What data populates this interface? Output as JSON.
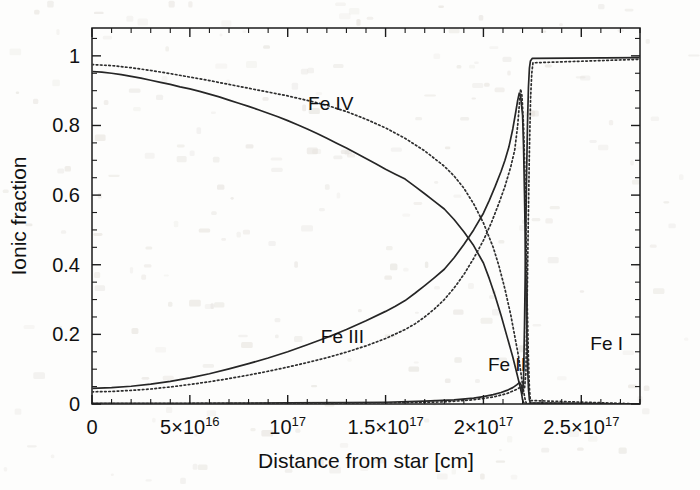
{
  "figure": {
    "name": "ionic-fraction-vs-distance",
    "background_color": "#fdfdfc",
    "ink_color": "#1b1b1b"
  },
  "axes": {
    "x": {
      "title": "Distance from star [cm]",
      "min": 0,
      "max": 2.8e+17,
      "major_ticks": [
        {
          "value": 0,
          "label": "0",
          "mantissa": "",
          "base": "",
          "exponent": ""
        },
        {
          "value": 5e+16,
          "label": "5×10¹⁶",
          "mantissa": "5×",
          "base": "10",
          "exponent": "16"
        },
        {
          "value": 1e+17,
          "label": "10¹⁷",
          "mantissa": "",
          "base": "10",
          "exponent": "17"
        },
        {
          "value": 1.5e+17,
          "label": "1.5×10¹⁷",
          "mantissa": "1.5×",
          "base": "10",
          "exponent": "17"
        },
        {
          "value": 2e+17,
          "label": "2×10¹⁷",
          "mantissa": "2×",
          "base": "10",
          "exponent": "17"
        },
        {
          "value": 2.5e+17,
          "label": "2.5×10¹⁷",
          "mantissa": "2.5×",
          "base": "10",
          "exponent": "17"
        }
      ],
      "minor_tick_step": 1e+16
    },
    "y": {
      "title": "Ionic fraction",
      "min": 0,
      "max": 1.08,
      "major_ticks": [
        {
          "value": 0,
          "label": "0"
        },
        {
          "value": 0.2,
          "label": "0.2"
        },
        {
          "value": 0.4,
          "label": "0.4"
        },
        {
          "value": 0.6,
          "label": "0.6"
        },
        {
          "value": 0.8,
          "label": "0.8"
        },
        {
          "value": 1,
          "label": "1"
        }
      ],
      "minor_tick_step": 0.05
    }
  },
  "annotations": [
    {
      "id": "fe4",
      "text": "Fe IV",
      "x": 1.22e+17,
      "y": 0.845
    },
    {
      "id": "fe3",
      "text": "Fe III",
      "x": 1.28e+17,
      "y": 0.175
    },
    {
      "id": "fe2",
      "text": "Fe II",
      "x": 2.12e+17,
      "y": 0.095
    },
    {
      "id": "fe1",
      "text": "Fe I",
      "x": 2.63e+17,
      "y": 0.155
    }
  ],
  "chart_data": {
    "type": "line",
    "title": "",
    "xlabel": "Distance from star [cm]",
    "ylabel": "Ionic fraction",
    "xlim": [
      0,
      2.8e+17
    ],
    "ylim": [
      0,
      1.08
    ],
    "grid": false,
    "legend": "inline-annotations",
    "x_units": "cm",
    "series": [
      {
        "name": "Fe IV (model A, solid)",
        "style": "solid",
        "points": [
          [
            0.0,
            0.955
          ],
          [
            5000000000000000.0,
            0.953
          ],
          [
            1e+16,
            0.95
          ],
          [
            1.5e+16,
            0.946
          ],
          [
            2e+16,
            0.941
          ],
          [
            2.5e+16,
            0.936
          ],
          [
            3e+16,
            0.93
          ],
          [
            3.5e+16,
            0.924
          ],
          [
            4e+16,
            0.918
          ],
          [
            4.5e+16,
            0.911
          ],
          [
            5e+16,
            0.905
          ],
          [
            5.5e+16,
            0.898
          ],
          [
            6e+16,
            0.89
          ],
          [
            6.5e+16,
            0.882
          ],
          [
            7e+16,
            0.873
          ],
          [
            7.5e+16,
            0.864
          ],
          [
            8e+16,
            0.855
          ],
          [
            8.5e+16,
            0.845
          ],
          [
            9e+16,
            0.835
          ],
          [
            9.5e+16,
            0.825
          ],
          [
            1e+17,
            0.814
          ],
          [
            1.05e+17,
            0.802
          ],
          [
            1.1e+17,
            0.79
          ],
          [
            1.15e+17,
            0.777
          ],
          [
            1.2e+17,
            0.763
          ],
          [
            1.25e+17,
            0.749
          ],
          [
            1.3e+17,
            0.735
          ],
          [
            1.35e+17,
            0.72
          ],
          [
            1.4e+17,
            0.705
          ],
          [
            1.45e+17,
            0.69
          ],
          [
            1.5e+17,
            0.674
          ],
          [
            1.55e+17,
            0.66
          ],
          [
            1.6e+17,
            0.646
          ],
          [
            1.65e+17,
            0.625
          ],
          [
            1.7e+17,
            0.604
          ],
          [
            1.75e+17,
            0.582
          ],
          [
            1.8e+17,
            0.56
          ],
          [
            1.85e+17,
            0.53
          ],
          [
            1.9e+17,
            0.495
          ],
          [
            1.95e+17,
            0.455
          ],
          [
            2e+17,
            0.405
          ],
          [
            2.03e+17,
            0.36
          ],
          [
            2.06e+17,
            0.31
          ],
          [
            2.09e+17,
            0.255
          ],
          [
            2.12e+17,
            0.195
          ],
          [
            2.15e+17,
            0.135
          ],
          [
            2.17e+17,
            0.09
          ],
          [
            2.185e+17,
            0.055
          ],
          [
            2.195e+17,
            0.03
          ],
          [
            2.2e+17,
            0.012
          ],
          [
            2.205e+17,
            0.004
          ],
          [
            2.21e+17,
            0.001
          ],
          [
            2.8e+17,
            0.0
          ]
        ]
      },
      {
        "name": "Fe IV (model B, dotted)",
        "style": "dotted",
        "points": [
          [
            0.0,
            0.975
          ],
          [
            1e+16,
            0.972
          ],
          [
            2e+16,
            0.966
          ],
          [
            3e+16,
            0.958
          ],
          [
            4e+16,
            0.949
          ],
          [
            5e+16,
            0.939
          ],
          [
            6e+16,
            0.929
          ],
          [
            7e+16,
            0.918
          ],
          [
            8e+16,
            0.907
          ],
          [
            9e+16,
            0.896
          ],
          [
            1e+17,
            0.885
          ],
          [
            1.1e+17,
            0.872
          ],
          [
            1.2e+17,
            0.858
          ],
          [
            1.3e+17,
            0.84
          ],
          [
            1.4e+17,
            0.818
          ],
          [
            1.5e+17,
            0.793
          ],
          [
            1.6e+17,
            0.763
          ],
          [
            1.7e+17,
            0.727
          ],
          [
            1.8e+17,
            0.683
          ],
          [
            1.85e+17,
            0.655
          ],
          [
            1.9e+17,
            0.62
          ],
          [
            1.95e+17,
            0.575
          ],
          [
            2e+17,
            0.52
          ],
          [
            2.05e+17,
            0.45
          ],
          [
            2.08e+17,
            0.395
          ],
          [
            2.11e+17,
            0.33
          ],
          [
            2.14e+17,
            0.255
          ],
          [
            2.16e+17,
            0.195
          ],
          [
            2.18e+17,
            0.135
          ],
          [
            2.19e+17,
            0.095
          ],
          [
            2.2e+17,
            0.055
          ],
          [
            2.21e+17,
            0.022
          ],
          [
            2.215e+17,
            0.008
          ],
          [
            2.22e+17,
            0.002
          ],
          [
            2.8e+17,
            0.0
          ]
        ]
      },
      {
        "name": "Fe III (model A, solid)",
        "style": "solid",
        "points": [
          [
            0.0,
            0.045
          ],
          [
            1e+16,
            0.047
          ],
          [
            2e+16,
            0.051
          ],
          [
            3e+16,
            0.057
          ],
          [
            4e+16,
            0.065
          ],
          [
            5e+16,
            0.075
          ],
          [
            6e+16,
            0.087
          ],
          [
            7e+16,
            0.101
          ],
          [
            8e+16,
            0.116
          ],
          [
            9e+16,
            0.132
          ],
          [
            1e+17,
            0.15
          ],
          [
            1.1e+17,
            0.17
          ],
          [
            1.2e+17,
            0.191
          ],
          [
            1.3e+17,
            0.214
          ],
          [
            1.4e+17,
            0.239
          ],
          [
            1.5e+17,
            0.266
          ],
          [
            1.55e+17,
            0.281
          ],
          [
            1.6e+17,
            0.297
          ],
          [
            1.65e+17,
            0.318
          ],
          [
            1.7e+17,
            0.34
          ],
          [
            1.75e+17,
            0.363
          ],
          [
            1.8e+17,
            0.387
          ],
          [
            1.85e+17,
            0.42
          ],
          [
            1.9e+17,
            0.458
          ],
          [
            1.95e+17,
            0.5
          ],
          [
            2e+17,
            0.548
          ],
          [
            2.03e+17,
            0.585
          ],
          [
            2.06e+17,
            0.625
          ],
          [
            2.09e+17,
            0.668
          ],
          [
            2.11e+17,
            0.7
          ],
          [
            2.13e+17,
            0.738
          ],
          [
            2.15e+17,
            0.79
          ],
          [
            2.165e+17,
            0.838
          ],
          [
            2.175e+17,
            0.872
          ],
          [
            2.183e+17,
            0.893
          ],
          [
            2.19e+17,
            0.885
          ],
          [
            2.2e+17,
            0.83
          ],
          [
            2.205e+17,
            0.74
          ],
          [
            2.21e+17,
            0.6
          ],
          [
            2.215e+17,
            0.42
          ],
          [
            2.22e+17,
            0.25
          ],
          [
            2.225e+17,
            0.12
          ],
          [
            2.23e+17,
            0.045
          ],
          [
            2.235e+17,
            0.012
          ],
          [
            2.24e+17,
            0.003
          ],
          [
            2.8e+17,
            0.0
          ]
        ]
      },
      {
        "name": "Fe III (model B, dotted)",
        "style": "dotted",
        "points": [
          [
            0.0,
            0.035
          ],
          [
            1e+16,
            0.036
          ],
          [
            2e+16,
            0.039
          ],
          [
            3e+16,
            0.043
          ],
          [
            4e+16,
            0.049
          ],
          [
            5e+16,
            0.056
          ],
          [
            6e+16,
            0.064
          ],
          [
            7e+16,
            0.073
          ],
          [
            8e+16,
            0.083
          ],
          [
            9e+16,
            0.094
          ],
          [
            1e+17,
            0.106
          ],
          [
            1.1e+17,
            0.119
          ],
          [
            1.2e+17,
            0.133
          ],
          [
            1.3e+17,
            0.149
          ],
          [
            1.4e+17,
            0.167
          ],
          [
            1.5e+17,
            0.188
          ],
          [
            1.6e+17,
            0.214
          ],
          [
            1.65e+17,
            0.23
          ],
          [
            1.7e+17,
            0.25
          ],
          [
            1.75e+17,
            0.273
          ],
          [
            1.8e+17,
            0.3
          ],
          [
            1.85e+17,
            0.333
          ],
          [
            1.9e+17,
            0.372
          ],
          [
            1.95e+17,
            0.418
          ],
          [
            2e+17,
            0.47
          ],
          [
            2.04e+17,
            0.52
          ],
          [
            2.08e+17,
            0.578
          ],
          [
            2.11e+17,
            0.625
          ],
          [
            2.14e+17,
            0.682
          ],
          [
            2.16e+17,
            0.73
          ],
          [
            2.175e+17,
            0.8
          ],
          [
            2.185e+17,
            0.87
          ],
          [
            2.19e+17,
            0.905
          ],
          [
            2.197e+17,
            0.885
          ],
          [
            2.205e+17,
            0.8
          ],
          [
            2.212e+17,
            0.66
          ],
          [
            2.218e+17,
            0.47
          ],
          [
            2.224e+17,
            0.28
          ],
          [
            2.23e+17,
            0.13
          ],
          [
            2.235e+17,
            0.045
          ],
          [
            2.24e+17,
            0.01
          ],
          [
            2.8e+17,
            0.0
          ]
        ]
      },
      {
        "name": "Fe II (model A, solid)",
        "style": "solid",
        "points": [
          [
            0.0,
            0.002
          ],
          [
            5e+16,
            0.002
          ],
          [
            1e+17,
            0.003
          ],
          [
            1.3e+17,
            0.004
          ],
          [
            1.5e+17,
            0.005
          ],
          [
            1.7e+17,
            0.008
          ],
          [
            1.85e+17,
            0.012
          ],
          [
            1.95e+17,
            0.017
          ],
          [
            2e+17,
            0.021
          ],
          [
            2.05e+17,
            0.027
          ],
          [
            2.09e+17,
            0.033
          ],
          [
            2.12e+17,
            0.039
          ],
          [
            2.15e+17,
            0.047
          ],
          [
            2.17e+17,
            0.055
          ],
          [
            2.185e+17,
            0.062
          ],
          [
            2.195e+17,
            0.052
          ],
          [
            2.2e+17,
            0.03
          ],
          [
            2.205e+17,
            0.07
          ],
          [
            2.21e+17,
            0.23
          ],
          [
            2.215e+17,
            0.44
          ],
          [
            2.22e+17,
            0.64
          ],
          [
            2.225e+17,
            0.8
          ],
          [
            2.23e+17,
            0.91
          ],
          [
            2.235e+17,
            0.965
          ],
          [
            2.24e+17,
            0.985
          ],
          [
            2.25e+17,
            0.993
          ],
          [
            2.8e+17,
            0.995
          ]
        ]
      },
      {
        "name": "Fe II (model B, dotted)",
        "style": "dotted",
        "points": [
          [
            0.0,
            0.001
          ],
          [
            1e+17,
            0.002
          ],
          [
            1.5e+17,
            0.003
          ],
          [
            1.8e+17,
            0.006
          ],
          [
            1.95e+17,
            0.012
          ],
          [
            2.05e+17,
            0.02
          ],
          [
            2.12e+17,
            0.03
          ],
          [
            2.17e+17,
            0.042
          ],
          [
            2.2e+17,
            0.052
          ],
          [
            2.21e+17,
            0.045
          ],
          [
            2.217e+17,
            0.09
          ],
          [
            2.223e+17,
            0.28
          ],
          [
            2.229e+17,
            0.52
          ],
          [
            2.235e+17,
            0.73
          ],
          [
            2.241e+17,
            0.88
          ],
          [
            2.247e+17,
            0.95
          ],
          [
            2.253e+17,
            0.98
          ],
          [
            2.8e+17,
            0.99
          ]
        ]
      }
    ],
    "ionization_front": {
      "x": 2.215e+17,
      "description": "sharp vertical transition at the ionization front"
    }
  }
}
